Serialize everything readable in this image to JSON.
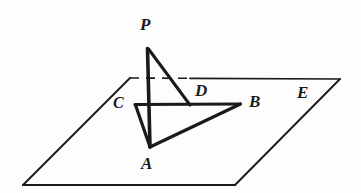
{
  "figure": {
    "background_color": "#fdfdfd",
    "stroke_color": "#1a1a1a",
    "label_color": "#1a1a1a"
  },
  "plane": {
    "name": "E",
    "corners": {
      "top_left": [
        130,
        78
      ],
      "top_right": [
        340,
        79
      ],
      "bottom_right": [
        235,
        185
      ],
      "bottom_left": [
        23,
        185
      ]
    },
    "back_edge_dashed_from_x": 130,
    "back_edge_dashed_to_x": 190
  },
  "points": {
    "P": [
      148,
      48
    ],
    "A": [
      150,
      147
    ],
    "B": [
      240,
      104
    ],
    "C": [
      135,
      104
    ],
    "D": [
      190,
      105
    ]
  },
  "segments": [
    {
      "id": "PA",
      "from": "P",
      "to": "A",
      "style": "solid",
      "weight": "thick"
    },
    {
      "id": "PD",
      "from": "P",
      "to": "D",
      "style": "solid",
      "weight": "thick"
    },
    {
      "id": "CB",
      "from": "C",
      "to": "B",
      "style": "solid",
      "weight": "thick"
    },
    {
      "id": "CA",
      "from": "C",
      "to": "A",
      "style": "solid",
      "weight": "thick"
    },
    {
      "id": "AB",
      "from": "A",
      "to": "B",
      "style": "solid",
      "weight": "thick"
    }
  ],
  "labels": {
    "P": {
      "text": "P",
      "x": 140,
      "y": 16,
      "size": 17
    },
    "C": {
      "text": "C",
      "x": 113,
      "y": 95,
      "size": 16
    },
    "D": {
      "text": "D",
      "x": 195,
      "y": 82,
      "size": 17
    },
    "B": {
      "text": "B",
      "x": 249,
      "y": 93,
      "size": 17
    },
    "E": {
      "text": "E",
      "x": 297,
      "y": 84,
      "size": 17
    },
    "A": {
      "text": "A",
      "x": 141,
      "y": 155,
      "size": 17
    }
  }
}
